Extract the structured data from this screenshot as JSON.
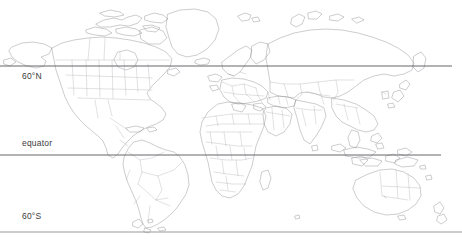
{
  "map": {
    "title": "World Map",
    "projection": "equirectangular",
    "background_color": "#ffffff",
    "coastline_color": "#8f8f93",
    "border_color": "#a9a9ad",
    "graticule_color": "#56565a",
    "label_color": "#3a3a3a",
    "width": 462,
    "height": 239,
    "latitude_lines": [
      {
        "id": "n60",
        "label": "60°N",
        "latitude": 60,
        "y": 66,
        "x_start": 0,
        "x_end": 452,
        "label_x": 22,
        "label_y": 71
      },
      {
        "id": "eq",
        "label": "equator",
        "latitude": 0,
        "y": 155,
        "x_start": 0,
        "x_end": 441,
        "label_x": 22,
        "label_y": 138
      },
      {
        "id": "s60",
        "label": "60°S",
        "latitude": -60,
        "y": 232,
        "x_start": 0,
        "x_end": 462,
        "label_x": 22,
        "label_y": 211
      }
    ],
    "regions": [
      "North America",
      "Greenland",
      "South America",
      "Europe",
      "Africa",
      "Asia",
      "Australia",
      "New Zealand",
      "Arctic Islands"
    ]
  }
}
